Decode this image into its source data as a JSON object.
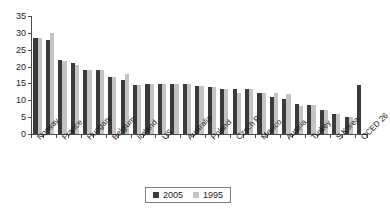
{
  "chart_data": {
    "type": "bar",
    "title": "",
    "subtitle": "",
    "xlabel": "",
    "ylabel": "",
    "ylim": [
      0,
      35
    ],
    "ytick_step": 5,
    "yticks": [
      0,
      5,
      10,
      15,
      20,
      25,
      30,
      35
    ],
    "grid": false,
    "legend_position": "bottom",
    "categories": [
      "Norway",
      "Sweden",
      "France",
      "Finland",
      "Hungary",
      "Denmark",
      "Belgium",
      "Italy",
      "Ireland",
      "Germany",
      "US",
      "Netherlands",
      "Australia",
      "Canada",
      "Poland",
      "UK",
      "Czech R",
      "Spain",
      "Mexico",
      "Portugal",
      "Austria",
      "Switzerland",
      "Turkey",
      "Japan",
      "S Korea",
      "Greece",
      "OCED 26"
    ],
    "visible_tick_labels": [
      "Norway",
      "France",
      "Hungary",
      "Belgium",
      "Ireland",
      "US",
      "Australia",
      "Poland",
      "Czech R",
      "Mexico",
      "Austria",
      "Turkey",
      "S Korea",
      "OCED 26"
    ],
    "series": [
      {
        "name": "2005",
        "color": "#3b3b3b",
        "values": [
          28.5,
          28.0,
          22.0,
          21.0,
          19.0,
          19.0,
          17.0,
          16.0,
          14.5,
          14.8,
          14.8,
          14.8,
          14.8,
          14.2,
          13.9,
          13.5,
          13.3,
          13.4,
          12.1,
          11.1,
          10.5,
          8.8,
          8.5,
          7.0,
          6.0,
          5.1,
          14.5
        ]
      },
      {
        "name": "1995",
        "color": "#c3c3c3",
        "values": [
          28.6,
          30.0,
          21.8,
          20.6,
          19.0,
          19.0,
          16.8,
          17.8,
          14.6,
          14.8,
          14.8,
          14.8,
          14.8,
          14.2,
          13.9,
          13.5,
          12.1,
          13.3,
          12.1,
          12.2,
          11.8,
          8.2,
          8.5,
          7.0,
          6.0,
          5.1,
          null
        ]
      }
    ],
    "legend": [
      {
        "label": "2005",
        "color": "#3b3b3b"
      },
      {
        "label": "1995",
        "color": "#c3c3c3"
      }
    ]
  }
}
